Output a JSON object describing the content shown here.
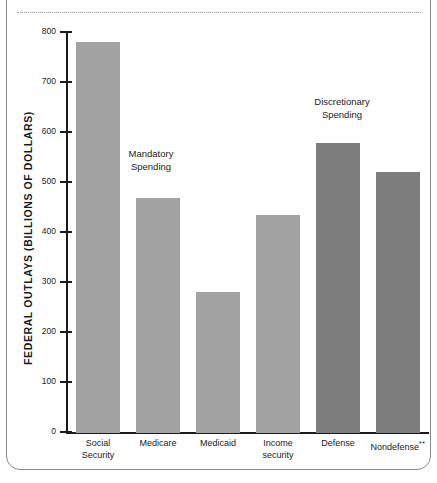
{
  "chart_data": {
    "type": "bar",
    "title": "",
    "xlabel": "",
    "ylabel": "FEDERAL OUTLAYS (BILLIONS OF DOLLARS)",
    "ylim": [
      0,
      800
    ],
    "ytick_values": [
      0,
      100,
      200,
      300,
      400,
      500,
      600,
      700,
      800
    ],
    "ytick_labels": [
      "0",
      "100",
      "200",
      "300",
      "400",
      "500",
      "600",
      "700",
      "800"
    ],
    "grid": false,
    "legend": "none",
    "categories": [
      "Social Security",
      "Medicare",
      "Medicaid",
      "Income security",
      "Defense",
      "Nondefense"
    ],
    "category_lines": [
      [
        "Social",
        "Security"
      ],
      [
        "Medicare",
        ""
      ],
      [
        "Medicaid",
        ""
      ],
      [
        "Income",
        "security"
      ],
      [
        "Defense",
        ""
      ],
      [
        "Nondefense",
        ""
      ]
    ],
    "category_superscripts": [
      "",
      "",
      "",
      "",
      "",
      "**"
    ],
    "values": [
      783,
      470,
      282,
      437,
      580,
      522
    ],
    "groups": [
      "mandatory",
      "mandatory",
      "mandatory",
      "mandatory",
      "discretionary",
      "discretionary"
    ],
    "annotations": [
      {
        "text_lines": [
          "Mandatory",
          "Spending"
        ],
        "text": "Mandatory Spending"
      },
      {
        "text_lines": [
          "Discretionary",
          "Spending"
        ],
        "text": "Discretionary Spending"
      }
    ],
    "colors": {
      "mandatory": "#a3a3a3",
      "discretionary": "#7d7d7d",
      "axis": "#1b1b1b",
      "frame": "#8a8a8a"
    }
  }
}
